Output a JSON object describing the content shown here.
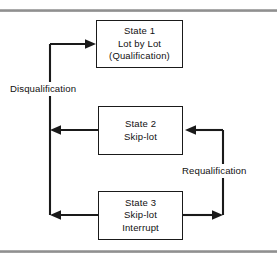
{
  "figure": {
    "background_color": "#ffffff",
    "line_color": "#1a1a1a",
    "rule_color": "#8d8d8d",
    "width": 277,
    "height": 259
  },
  "states": [
    {
      "id": "state-1",
      "name": "State 1",
      "line1": "State 1",
      "line2": "Lot by Lot",
      "line3": "(Qualification)",
      "x": 96,
      "y": 20,
      "w": 87,
      "h": 48
    },
    {
      "id": "state-2",
      "name": "State 2",
      "line1": "State 2",
      "line2": "Skip-lot",
      "line3": "",
      "x": 98,
      "y": 106,
      "w": 85,
      "h": 49
    },
    {
      "id": "state-3",
      "name": "State 3",
      "line1": "State 3",
      "line2": "Skip-lot",
      "line3": "Interrupt",
      "x": 98,
      "y": 191,
      "w": 85,
      "h": 49
    }
  ],
  "transitions": [
    {
      "id": "disqualification",
      "label": "Disqualification",
      "from": "State 2 / State 3",
      "to": "State 1",
      "direction": "up-then-right",
      "label_x": 8,
      "label_y": 82
    },
    {
      "id": "requalification",
      "label": "Requalification",
      "from": "State 3",
      "to": "State 2",
      "direction": "right-then-up",
      "label_x": 180,
      "label_y": 164
    }
  ],
  "rules": {
    "top_label": "top-divider-rule",
    "bottom_label": "bottom-divider-rule"
  }
}
